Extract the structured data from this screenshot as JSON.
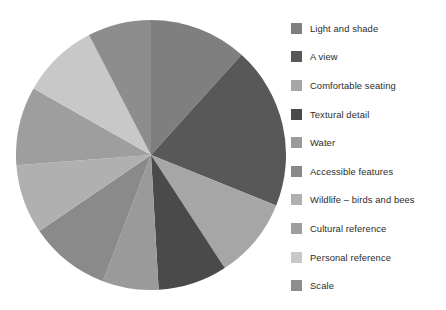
{
  "chart_data": {
    "type": "pie",
    "title": "",
    "subtitle": "",
    "xlabel": "",
    "ylabel": "",
    "legend_position": "right",
    "grid": false,
    "start_angle_deg": 0,
    "direction": "clockwise",
    "categories": [
      "Light and shade",
      "A view",
      "Comfortable seating",
      "Textural detail",
      "Water",
      "Accessible features",
      "Wildlife – birds and bees",
      "Cultural reference",
      "Personal reference",
      "Scale"
    ],
    "values": [
      11.7,
      19.4,
      9.7,
      8.3,
      6.7,
      9.7,
      8.3,
      9.4,
      9.2,
      7.6
    ],
    "colors": [
      "#7f7f7f",
      "#585858",
      "#a6a6a6",
      "#4a4a4a",
      "#9a9a9a",
      "#8a8a8a",
      "#b0b0b0",
      "#9e9e9e",
      "#c8c8c8",
      "#8d8d8d"
    ]
  },
  "legend": {
    "items": [
      {
        "label": "Light and shade",
        "color": "#7f7f7f"
      },
      {
        "label": "A view",
        "color": "#585858"
      },
      {
        "label": "Comfortable seating",
        "color": "#a6a6a6"
      },
      {
        "label": "Textural detail",
        "color": "#4a4a4a"
      },
      {
        "label": "Water",
        "color": "#9a9a9a"
      },
      {
        "label": "Accessible features",
        "color": "#8a8a8a"
      },
      {
        "label": "Wildlife – birds and bees",
        "color": "#b0b0b0"
      },
      {
        "label": "Cultural reference",
        "color": "#9e9e9e"
      },
      {
        "label": "Personal reference",
        "color": "#c8c8c8"
      },
      {
        "label": "Scale",
        "color": "#8d8d8d"
      }
    ]
  }
}
